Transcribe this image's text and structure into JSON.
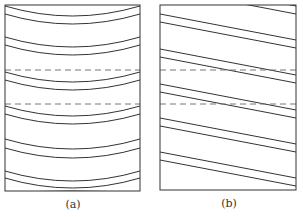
{
  "figure": {
    "panels": [
      {
        "id": "a",
        "label": "(a)",
        "description": "Parallel curved bands (arcs) inside a rectangle, crossed by two horizontal dashed lines",
        "box": {
          "x": 5,
          "y": 5,
          "width": 135,
          "height": 186
        },
        "curve_pairs_edge_y": [
          [
            6,
            14
          ],
          [
            37,
            45
          ],
          [
            72,
            80
          ],
          [
            106,
            114
          ],
          [
            139,
            148
          ],
          [
            171,
            178
          ]
        ],
        "curve_sag": 10,
        "dashed_lines_y": [
          70,
          104
        ]
      },
      {
        "id": "b",
        "label": "(b)",
        "description": "Parallel straight slanted bands inside a rectangle, crossed by two horizontal dashed lines",
        "box": {
          "x": 160,
          "y": 5,
          "width": 136,
          "height": 185
        },
        "line_pairs_left_y": [
          [
            14,
            22
          ],
          [
            49,
            57
          ],
          [
            84,
            92
          ],
          [
            118,
            126
          ],
          [
            152,
            160
          ]
        ],
        "line_slope_drop": 26,
        "dashed_lines_y": [
          70,
          104
        ]
      }
    ],
    "stroke_color": "#333333",
    "dash_color": "#777777"
  }
}
